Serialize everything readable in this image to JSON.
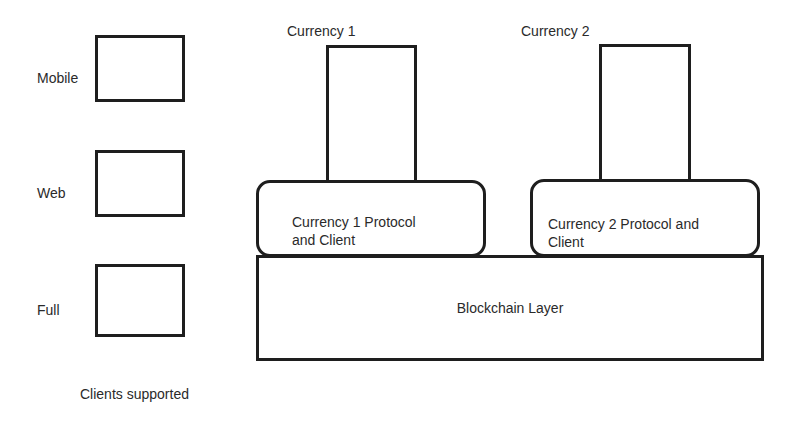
{
  "diagram": {
    "clients": {
      "caption": "Clients supported",
      "items": [
        {
          "label": "Mobile"
        },
        {
          "label": "Web"
        },
        {
          "label": "Full"
        }
      ]
    },
    "currencies": [
      {
        "title": "Currency 1",
        "protocol_line1": "Currency 1 Protocol",
        "protocol_line2": "and Client"
      },
      {
        "title": "Currency 2",
        "protocol_line1": "Currency 2 Protocol and",
        "protocol_line2": "Client"
      }
    ],
    "base_layer": {
      "label": "Blockchain Layer"
    },
    "colors": {
      "stroke": "#1e1e1e",
      "text": "#2a2a2a",
      "background": "#ffffff"
    }
  }
}
